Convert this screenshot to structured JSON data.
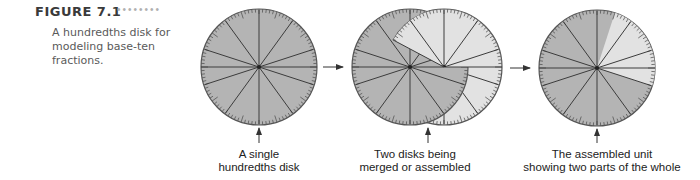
{
  "figure": {
    "label": "FIGURE 7.1",
    "dots": "••••••••",
    "caption": "A hundredths disk for modeling base-ten fractions."
  },
  "colors": {
    "dark_fill": "#b4b4b4",
    "light_fill": "#e2e2e2",
    "line": "#3c3c3c",
    "rim": "#555555"
  },
  "disks": [
    {
      "id": "single",
      "caption_line1": "A single",
      "caption_line2": "hundredths disk",
      "sectors": 10,
      "ticks": 100,
      "light_fraction": 0
    },
    {
      "id": "merging",
      "caption_line1": "Two disks being",
      "caption_line2": "merged or assembled",
      "sectors": 10,
      "ticks": 100
    },
    {
      "id": "assembled",
      "caption_line1": "The assembled unit",
      "caption_line2": "showing two parts of the whole",
      "sectors": 10,
      "ticks": 100,
      "light_fraction": 0.25
    }
  ]
}
